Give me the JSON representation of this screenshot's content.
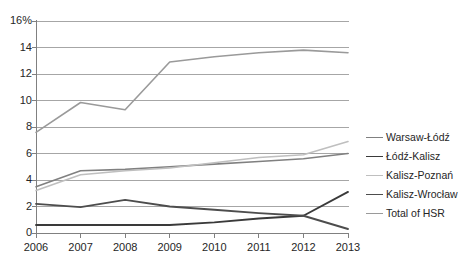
{
  "chart_data": {
    "type": "line",
    "title": "",
    "xlabel": "",
    "ylabel": "",
    "x": [
      2006,
      2007,
      2008,
      2009,
      2010,
      2011,
      2012,
      2013
    ],
    "categories": [
      "2006",
      "2007",
      "2008",
      "2009",
      "2010",
      "2011",
      "2012",
      "2013"
    ],
    "ylim": [
      0,
      16
    ],
    "yticks": [
      0,
      2,
      4,
      6,
      8,
      10,
      12,
      14,
      16
    ],
    "ytick_labels": [
      "0",
      "2",
      "4",
      "6",
      "8",
      "10",
      "12",
      "14",
      "16%"
    ],
    "grid": "horizontal",
    "legend_position": "right",
    "series": [
      {
        "name": "Warsaw-Łódź",
        "color": "#808080",
        "width": 1.6,
        "values": [
          3.5,
          4.7,
          4.8,
          5.0,
          5.2,
          5.4,
          5.6,
          6.0
        ]
      },
      {
        "name": "Łódź-Kalisz",
        "color": "#3a3a3a",
        "width": 1.9,
        "values": [
          0.6,
          0.6,
          0.6,
          0.6,
          0.8,
          1.1,
          1.3,
          3.1
        ]
      },
      {
        "name": "Kalisz-Poznań",
        "color": "#bfbfbf",
        "width": 1.6,
        "values": [
          3.2,
          4.4,
          4.7,
          4.9,
          5.3,
          5.7,
          5.9,
          6.9
        ]
      },
      {
        "name": "Kalisz-Wrocław",
        "color": "#4d4d4d",
        "width": 1.9,
        "values": [
          2.2,
          1.95,
          2.5,
          2.0,
          1.75,
          1.5,
          1.3,
          0.3
        ]
      },
      {
        "name": "Total of HSR",
        "color": "#9a9a9a",
        "width": 1.6,
        "values": [
          7.6,
          9.85,
          9.3,
          12.9,
          13.3,
          13.6,
          13.8,
          13.6
        ]
      }
    ]
  },
  "legend": {
    "items": [
      {
        "label": "Warsaw-Łódź"
      },
      {
        "label": "Łódź-Kalisz"
      },
      {
        "label": "Kalisz-Poznań"
      },
      {
        "label": "Kalisz-Wrocław"
      },
      {
        "label": "Total of HSR"
      }
    ]
  }
}
